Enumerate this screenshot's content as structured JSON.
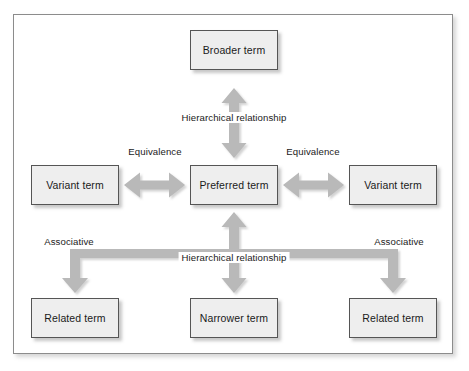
{
  "diagram": {
    "colors": {
      "box_fill": "#eeeeee",
      "box_border": "#555555",
      "arrow": "#b9b9b9",
      "frame_border": "#8c8c8c",
      "text": "#1a1a1a",
      "background": "#ffffff"
    },
    "nodes": [
      {
        "id": "broader",
        "label": "Broader term",
        "x": 190,
        "y": 30,
        "w": 88,
        "h": 40
      },
      {
        "id": "variant_left",
        "label": "Variant term",
        "x": 31,
        "y": 165,
        "w": 88,
        "h": 40
      },
      {
        "id": "preferred",
        "label": "Preferred term",
        "x": 190,
        "y": 165,
        "w": 88,
        "h": 40
      },
      {
        "id": "variant_right",
        "label": "Variant term",
        "x": 349,
        "y": 165,
        "w": 88,
        "h": 40
      },
      {
        "id": "related_left",
        "label": "Related term",
        "x": 31,
        "y": 298,
        "w": 88,
        "h": 40
      },
      {
        "id": "narrower",
        "label": "Narrower term",
        "x": 190,
        "y": 298,
        "w": 88,
        "h": 40
      },
      {
        "id": "related_right",
        "label": "Related term",
        "x": 349,
        "y": 298,
        "w": 88,
        "h": 40
      }
    ],
    "edge_labels": [
      {
        "id": "hier_top",
        "text": "Hierarchical relationship",
        "x": 234,
        "y": 112
      },
      {
        "id": "equiv_left",
        "text": "Equivalence",
        "x": 155,
        "y": 146
      },
      {
        "id": "equiv_right",
        "text": "Equivalence",
        "x": 313,
        "y": 146
      },
      {
        "id": "assoc_left",
        "text": "Associative",
        "x": 69,
        "y": 236
      },
      {
        "id": "assoc_right",
        "text": "Associative",
        "x": 399,
        "y": 236
      },
      {
        "id": "hier_bottom",
        "text": "Hierarchical relationship",
        "x": 234,
        "y": 252
      }
    ],
    "connectors": [
      {
        "id": "broader-preferred",
        "kind": "double-vertical",
        "from": "preferred",
        "to": "broader",
        "relation": "Hierarchical relationship"
      },
      {
        "id": "variantleft-preferred",
        "kind": "double-horizontal",
        "from": "variant_left",
        "to": "preferred",
        "relation": "Equivalence"
      },
      {
        "id": "preferred-variantright",
        "kind": "double-horizontal",
        "from": "preferred",
        "to": "variant_right",
        "relation": "Equivalence"
      },
      {
        "id": "preferred-narrower",
        "kind": "double-vertical",
        "from": "preferred",
        "to": "narrower",
        "relation": "Hierarchical relationship"
      },
      {
        "id": "preferred-relatedleft",
        "kind": "elbow-down-left",
        "from": "preferred",
        "to": "related_left",
        "relation": "Associative"
      },
      {
        "id": "preferred-relatedright",
        "kind": "elbow-down-right",
        "from": "preferred",
        "to": "related_right",
        "relation": "Associative"
      }
    ]
  }
}
